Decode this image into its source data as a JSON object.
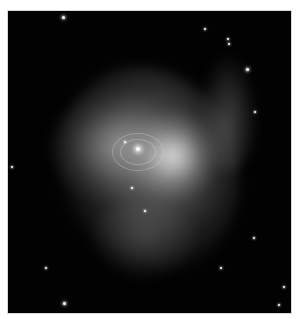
{
  "image": {
    "subject": "Crab Nebula",
    "description": "Grayscale telescope image of a supernova remnant nebula with bright central pulsar region, filamentary wisps and scattered foreground stars, in a black frame with white border",
    "colors": {
      "border": "#ffffff",
      "background": "#020202",
      "nebula": "#aaaaaa",
      "core": "#f0f0f0"
    }
  }
}
